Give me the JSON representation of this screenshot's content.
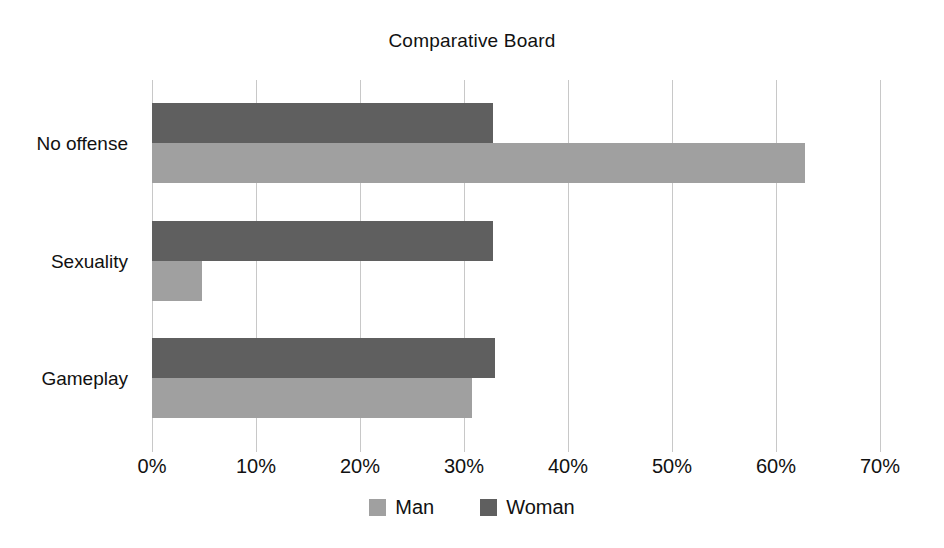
{
  "chart_data": {
    "type": "bar",
    "orientation": "horizontal",
    "title": "Comparative Board",
    "xlabel": "",
    "ylabel": "",
    "categories": [
      "No offense",
      "Sexuality",
      "Gameplay"
    ],
    "series": [
      {
        "name": "Man",
        "color": "#a0a0a0",
        "values": [
          62.8,
          4.8,
          30.8
        ]
      },
      {
        "name": "Woman",
        "color": "#5f5f5f",
        "values": [
          32.8,
          32.8,
          33.0
        ]
      }
    ],
    "xlim": [
      0,
      70
    ],
    "xticks": [
      0,
      10,
      20,
      30,
      40,
      50,
      60,
      70
    ],
    "xtick_labels": [
      "0%",
      "10%",
      "20%",
      "30%",
      "40%",
      "50%",
      "60%",
      "70%"
    ],
    "grid": "vertical",
    "legend_position": "bottom-center",
    "value_suffix": "%"
  },
  "colors": {
    "man": "#a0a0a0",
    "woman": "#5f5f5f",
    "gridline": "#c8c8c8",
    "text": "#111111",
    "background": "#ffffff"
  }
}
